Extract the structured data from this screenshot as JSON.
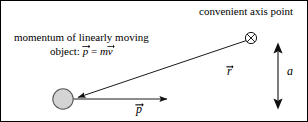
{
  "figure": {
    "title_text": "convenient axis point",
    "width": 308,
    "height": 122,
    "border_color": "#000000",
    "background_color": "#ffffff",
    "stroke_color": "#1a1a1a"
  },
  "labels": {
    "axis_point_caption": "convenient axis point",
    "momentum_caption_line1": "momentum of linearly moving",
    "momentum_caption_line2_prefix": "object: ",
    "momentum_caption_p": "p",
    "momentum_caption_equals": " = ",
    "momentum_caption_m": "m",
    "momentum_caption_v": "v",
    "vector_r": "r",
    "vector_p": "p",
    "distance_a": "a"
  },
  "icons": {
    "axis_point": "crossed-circle-icon",
    "object": "gray-filled-circle-icon",
    "r_vector": "arrow-icon",
    "p_vector": "arrow-icon",
    "distance_marker": "double-headed-arrow-icon"
  },
  "geometry": {
    "axis_point": {
      "cx": 250,
      "cy": 37,
      "r": 5.6
    },
    "object_circle": {
      "cx": 62,
      "cy": 98,
      "r": 10.5,
      "fill": "#d4d4d4",
      "stroke": "#4d4d4d"
    },
    "r_vector": {
      "x1": 245,
      "y1": 40,
      "x2": 75,
      "y2": 97
    },
    "p_vector": {
      "x1": 71,
      "y1": 98,
      "x2": 172,
      "y2": 98
    },
    "distance_marker": {
      "x": 277,
      "y_top": 42,
      "y_bottom": 108
    }
  }
}
